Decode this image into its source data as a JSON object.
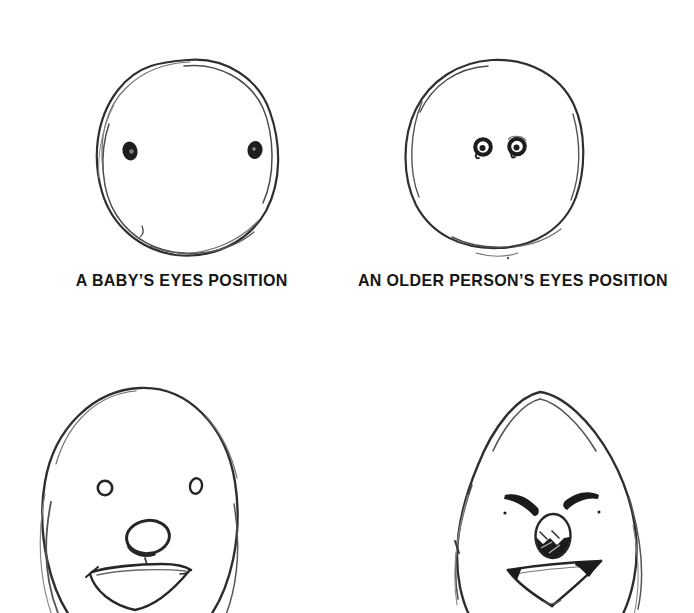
{
  "page": {
    "background_color": "#ffffff",
    "ink_color": "#2e2e2e",
    "label_color": "#161616"
  },
  "captions": {
    "baby": "A BABY’S EYES POSITION",
    "older": "AN OLDER PERSON’S EYES POSITION"
  },
  "sketches": [
    {
      "name": "baby-face-sketch",
      "meaning": "round face with wide-set dark eyes at mid height"
    },
    {
      "name": "older-person-face-sketch",
      "meaning": "round face with close-set button eyes at mid height"
    },
    {
      "name": "youthful-full-face-sketch",
      "meaning": "egg-shaped face, open-line eyes and nose, open smile"
    },
    {
      "name": "aged-full-face-sketch",
      "meaning": "egg-shaped face, dark angled eyes, shaded nose, open triangular mouth"
    }
  ]
}
